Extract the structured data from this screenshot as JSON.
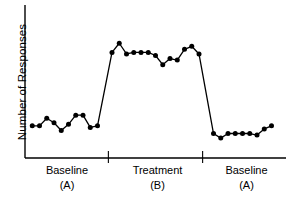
{
  "chart_data": {
    "type": "line",
    "title": "",
    "xlabel": "",
    "ylabel": "Number of Responses",
    "xlim": [
      0,
      36
    ],
    "ylim": [
      0,
      10
    ],
    "grid": false,
    "legend": false,
    "marker": "filled-circle",
    "line_color": "#000000",
    "marker_color": "#000000",
    "axis_color": "#000000",
    "background": "#ffffff",
    "axis_ticks_shown": false,
    "phases": [
      {
        "name": "Baseline",
        "letter": "(A)",
        "label": "Baseline (A)",
        "x_start": 0,
        "x_end": 11.5,
        "values": [
          2.1,
          2.1,
          2.6,
          2.3,
          1.8,
          2.2,
          2.8,
          2.8,
          2.0,
          2.1
        ]
      },
      {
        "name": "Treatment",
        "letter": "(B)",
        "label": "Treatment (B)",
        "x_start": 11.5,
        "x_end": 24.5,
        "values": [
          6.9,
          7.5,
          6.8,
          6.9,
          6.9,
          6.9,
          6.7,
          6.1,
          6.5,
          6.4,
          7.1,
          7.3,
          6.8
        ]
      },
      {
        "name": "Baseline",
        "letter": "(A)",
        "label": "Baseline (A)",
        "x_start": 24.5,
        "x_end": 36,
        "values": [
          1.6,
          1.3,
          1.6,
          1.6,
          1.6,
          1.6,
          1.5,
          1.9,
          2.1
        ]
      }
    ],
    "x": [
      1,
      2,
      3,
      4,
      5,
      6,
      7,
      8,
      9,
      10,
      12,
      13,
      14,
      15,
      16,
      17,
      18,
      19,
      20,
      21,
      22,
      23,
      24,
      26,
      27,
      28,
      29,
      30,
      31,
      32,
      33,
      34
    ],
    "values": [
      2.1,
      2.1,
      2.6,
      2.3,
      1.8,
      2.2,
      2.8,
      2.8,
      2.0,
      2.1,
      6.9,
      7.5,
      6.8,
      6.9,
      6.9,
      6.9,
      6.7,
      6.1,
      6.5,
      6.4,
      7.1,
      7.3,
      6.8,
      1.6,
      1.3,
      1.6,
      1.6,
      1.6,
      1.6,
      1.5,
      1.9,
      2.1
    ],
    "phase_dividers": [
      11.5,
      24.5
    ]
  },
  "axes": {
    "y_title": "Number of Responses"
  },
  "phase_labels": [
    {
      "name": "Baseline",
      "letter": "(A)"
    },
    {
      "name": "Treatment",
      "letter": "(B)"
    },
    {
      "name": "Baseline",
      "letter": "(A)"
    }
  ]
}
